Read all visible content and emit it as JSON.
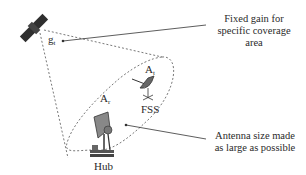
{
  "diagram": {
    "satellite": {
      "label": "satellite",
      "gain_symbol": "g",
      "gain_subscript": "t"
    },
    "hub": {
      "label": "Hub",
      "area_symbol": "A",
      "area_subscript": "r"
    },
    "fss": {
      "label": "FSS",
      "area_symbol": "A",
      "area_subscript": "t"
    },
    "callouts": [
      {
        "id": "gain",
        "text_lines": [
          "Fixed gain for",
          "specific coverage",
          "area"
        ]
      },
      {
        "id": "antenna",
        "text_lines": [
          "Antenna size made",
          "as large as possible"
        ]
      }
    ],
    "colors": {
      "line": "#333333",
      "dashed": "#555555",
      "icon": "#333333"
    }
  }
}
